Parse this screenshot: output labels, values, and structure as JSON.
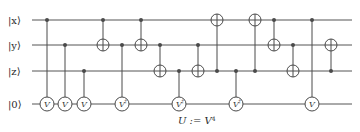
{
  "figure": {
    "width": 360,
    "height": 132,
    "background": "#ffffff",
    "wire_color": "#555555",
    "gate_color": "#4a4a4a"
  },
  "wires": [
    {
      "id": "x",
      "label": "|x⟩",
      "y": 20
    },
    {
      "id": "y",
      "label": "|y⟩",
      "y": 45
    },
    {
      "id": "z",
      "label": "|z⟩",
      "y": 71
    },
    {
      "id": "anc",
      "label": "|0⟩",
      "y": 104
    }
  ],
  "caption": {
    "text": "U := V",
    "superscript": "4",
    "full": "U := V⁴",
    "x": 178,
    "y": 124
  },
  "gates": [
    {
      "id": "g1",
      "type": "controlled-v",
      "label": "V",
      "sup": "",
      "x": 47,
      "control_wire": "x",
      "target_wire": "anc"
    },
    {
      "id": "g2",
      "type": "controlled-v",
      "label": "V",
      "sup": "",
      "x": 65,
      "control_wire": "y",
      "target_wire": "anc"
    },
    {
      "id": "g3",
      "type": "controlled-v",
      "label": "V",
      "sup": "",
      "x": 84,
      "control_wire": "z",
      "target_wire": "anc"
    },
    {
      "id": "g4",
      "type": "cnot",
      "x": 103,
      "control_wire": "x",
      "target_wire": "y"
    },
    {
      "id": "g5",
      "type": "controlled-v",
      "label": "V",
      "sup": "†",
      "x": 122,
      "control_wire": "y",
      "target_wire": "anc"
    },
    {
      "id": "g6",
      "type": "cnot",
      "x": 141,
      "control_wire": "x",
      "target_wire": "y"
    },
    {
      "id": "g7",
      "type": "cnot",
      "x": 160,
      "control_wire": "y",
      "target_wire": "z"
    },
    {
      "id": "g8",
      "type": "controlled-v",
      "label": "V",
      "sup": "†",
      "x": 179,
      "control_wire": "z",
      "target_wire": "anc"
    },
    {
      "id": "g9",
      "type": "cnot",
      "x": 198,
      "control_wire": "y",
      "target_wire": "z"
    },
    {
      "id": "g10",
      "type": "cnot",
      "x": 217,
      "control_wire": "z",
      "target_wire": "x"
    },
    {
      "id": "g11",
      "type": "controlled-v",
      "label": "V",
      "sup": "†",
      "x": 236,
      "control_wire": "z",
      "target_wire": "anc"
    },
    {
      "id": "g12",
      "type": "cnot",
      "x": 255,
      "control_wire": "z",
      "target_wire": "x"
    },
    {
      "id": "g13",
      "type": "cnot",
      "x": 274,
      "control_wire": "x",
      "target_wire": "y"
    },
    {
      "id": "g14",
      "type": "cnot",
      "x": 293,
      "control_wire": "y",
      "target_wire": "z"
    },
    {
      "id": "g15",
      "type": "controlled-v",
      "label": "V",
      "sup": "",
      "x": 312,
      "control_wire": "x",
      "target_wire": "anc"
    },
    {
      "id": "g16",
      "type": "cnot",
      "x": 331,
      "control_wire": "z",
      "target_wire": "y"
    }
  ]
}
